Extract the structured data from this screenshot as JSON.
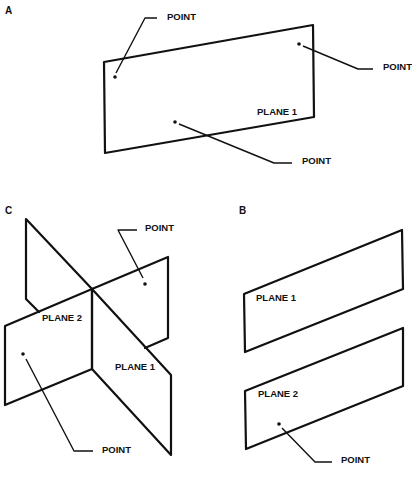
{
  "figure": {
    "panels": [
      {
        "id": "A",
        "label": "A",
        "planes": [
          {
            "label": "PLANE 1"
          }
        ],
        "points": [
          {
            "label": "POINT"
          },
          {
            "label": "POINT"
          },
          {
            "label": "POINT"
          }
        ]
      },
      {
        "id": "B",
        "label": "B",
        "planes": [
          {
            "label": "PLANE 1"
          },
          {
            "label": "PLANE 2"
          }
        ],
        "points": [
          {
            "label": "POINT"
          }
        ]
      },
      {
        "id": "C",
        "label": "C",
        "planes": [
          {
            "label": "PLANE 1"
          },
          {
            "label": "PLANE 2"
          }
        ],
        "points": [
          {
            "label": "POINT"
          },
          {
            "label": "POINT"
          }
        ]
      }
    ]
  }
}
